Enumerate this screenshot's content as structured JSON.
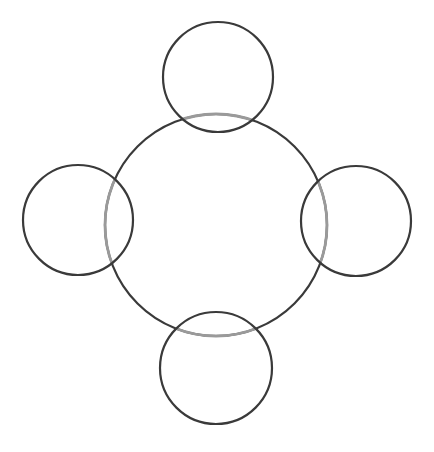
{
  "diagram": {
    "width": 434,
    "height": 452,
    "background": "#ffffff",
    "stroke_color": "#3a3a3a",
    "overlap_stroke_color": "#9a9a9a",
    "stroke_width": 2.2,
    "central_circle": {
      "cx": 216,
      "cy": 225,
      "r": 111
    },
    "satellite_circles": [
      {
        "id": "top",
        "cx": 218,
        "cy": 77,
        "r": 55
      },
      {
        "id": "left",
        "cx": 78,
        "cy": 220,
        "r": 55
      },
      {
        "id": "right",
        "cx": 356,
        "cy": 221,
        "r": 55
      },
      {
        "id": "bottom",
        "cx": 216,
        "cy": 368,
        "r": 56
      }
    ]
  }
}
